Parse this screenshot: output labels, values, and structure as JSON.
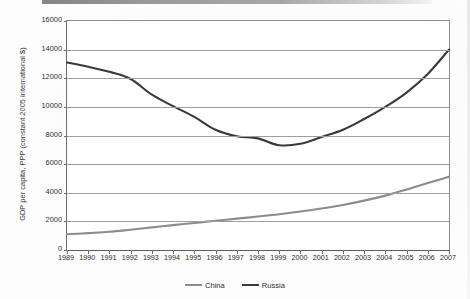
{
  "chart_data": {
    "type": "line",
    "title": "",
    "subtitle": "",
    "xlabel": "",
    "ylabel": "GDP per capita, PPP (constant 2005 international $)",
    "x": [
      1989,
      1990,
      1991,
      1992,
      1993,
      1994,
      1995,
      1996,
      1997,
      1998,
      1999,
      2000,
      2001,
      2002,
      2003,
      2004,
      2005,
      2006,
      2007
    ],
    "xtick_labels": [
      "1989",
      "1990",
      "1991",
      "1992",
      "1993",
      "1994",
      "1995",
      "1996",
      "1997",
      "1998",
      "1999",
      "2000",
      "2001",
      "2002",
      "2003",
      "2004",
      "2005",
      "2006",
      "2007"
    ],
    "ytick_labels": [
      "16000",
      "14000",
      "12000",
      "10000",
      "8000",
      "6000",
      "4000",
      "2000",
      "0"
    ],
    "ytick_values": [
      16000,
      14000,
      12000,
      10000,
      8000,
      6000,
      4000,
      2000,
      0
    ],
    "xlim": [
      1989,
      2007
    ],
    "ylim": [
      0,
      16000
    ],
    "grid": "horizontal",
    "legend_position": "bottom-center",
    "series": [
      {
        "name": "China",
        "color": "#8c8c8c",
        "values": [
          1100,
          1180,
          1270,
          1420,
          1580,
          1740,
          1890,
          2040,
          2190,
          2340,
          2500,
          2690,
          2900,
          3150,
          3450,
          3800,
          4220,
          4680,
          5120
        ]
      },
      {
        "name": "Russia",
        "color": "#3a3a3a",
        "values": [
          13100,
          12800,
          12450,
          11950,
          10850,
          10050,
          9300,
          8400,
          7950,
          7800,
          7320,
          7420,
          7900,
          8400,
          9150,
          10000,
          11000,
          12300,
          14000
        ]
      }
    ],
    "legend": [
      {
        "label": "China",
        "color": "#8c8c8c"
      },
      {
        "label": "Russia",
        "color": "#3a3a3a"
      }
    ]
  }
}
